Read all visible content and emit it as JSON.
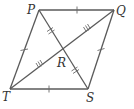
{
  "figure": {
    "shape": "rhombus",
    "vertices": {
      "P": {
        "label": "P",
        "x": 39,
        "y": 10
      },
      "Q": {
        "label": "Q",
        "x": 114,
        "y": 10
      },
      "S": {
        "label": "S",
        "x": 88,
        "y": 89
      },
      "T": {
        "label": "T",
        "x": 10,
        "y": 89
      }
    },
    "intersection": {
      "label": "R",
      "x": 63,
      "y": 50
    },
    "sides": [
      "PQ",
      "QS",
      "ST",
      "TP"
    ],
    "diagonals": [
      "PS",
      "QT"
    ],
    "tick_marks": {
      "PQ": 1,
      "QS": 1,
      "ST": 1,
      "TP": 1,
      "PR": 2,
      "RS": 2,
      "QR": 3,
      "RT": 3
    },
    "colors": {
      "line": "#5a5a5a",
      "label": "#333333",
      "background": "#ffffff"
    }
  },
  "labels": {
    "P": "P",
    "Q": "Q",
    "R": "R",
    "S": "S",
    "T": "T"
  }
}
